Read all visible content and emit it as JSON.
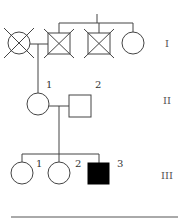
{
  "diagram": {
    "type": "pedigree",
    "stroke_color": "#444444",
    "affected_fill": "#000000",
    "generations": [
      {
        "label": "I"
      },
      {
        "label": "II"
      },
      {
        "label": "III"
      }
    ],
    "individuals": {
      "gen1": [
        {
          "sex": "female",
          "status": "deceased"
        },
        {
          "sex": "male",
          "status": "deceased"
        },
        {
          "sex": "male",
          "status": "deceased"
        },
        {
          "sex": "female",
          "status": "unaffected"
        }
      ],
      "gen2": [
        {
          "id": "1",
          "sex": "female",
          "status": "unaffected"
        },
        {
          "id": "2",
          "sex": "male",
          "status": "unaffected"
        }
      ],
      "gen3": [
        {
          "id": "1",
          "sex": "female",
          "status": "unaffected"
        },
        {
          "id": "2",
          "sex": "female",
          "status": "unaffected"
        },
        {
          "id": "3",
          "sex": "male",
          "status": "affected"
        }
      ]
    }
  }
}
